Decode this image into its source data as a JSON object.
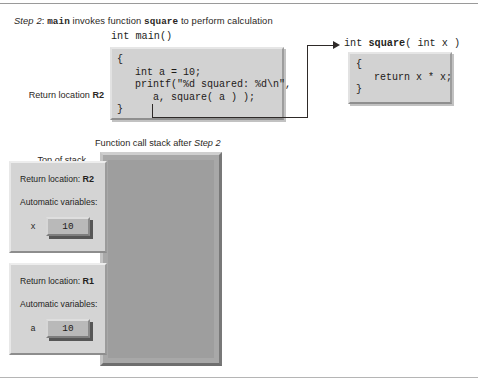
{
  "caption": {
    "prefix": "Step 2",
    "separator": ": ",
    "func_main": "main",
    "middle": " invokes function ",
    "func_square": "square",
    "suffix": " to perform calculation"
  },
  "code": {
    "main_signature": "int main()",
    "main_body": "{\n   int a = 10;\n   printf(\"%d squared: %d\\n\",\n      a, square( a ) );\n}",
    "square_signature_prefix": "int ",
    "square_signature_name": "square",
    "square_signature_suffix": "( int x )",
    "square_body": "{\n   return x * x;\n}"
  },
  "labels": {
    "return_location_prefix": "Return location ",
    "return_location_value": "R2",
    "top_of_stack": "Top of stack",
    "stack_frame_for_line1": "Stack frame for",
    "stack_frame_for_line2_prefix": "function ",
    "stack_frame_square_func": "square",
    "stack_frame_main_line1": "Stack frame",
    "stack_frame_main_line2_prefix": "for function ",
    "stack_frame_main_func": "main"
  },
  "stack": {
    "caption_prefix": "Function call stack after ",
    "caption_step": "Step 2",
    "frames": [
      {
        "name": "square-frame",
        "return_label": "Return location: ",
        "return_value": "R2",
        "auto_label": "Automatic variables:",
        "var_name": "x",
        "var_value": "10"
      },
      {
        "name": "main-frame",
        "return_label": "Return location: ",
        "return_value": "R1",
        "auto_label": "Automatic variables:",
        "var_name": "a",
        "var_value": "10"
      }
    ]
  },
  "colors": {
    "page_background": "#ffffff",
    "code_box_fill": "#d2d2d2",
    "stack_outer_fill": "#a8a8a8",
    "stack_inner_fill": "#9e9e9e",
    "frame_fill": "#d4d4d4",
    "value_box_fill": "#b9b9b9",
    "line": "#2e2a28",
    "text": "#231f20"
  }
}
